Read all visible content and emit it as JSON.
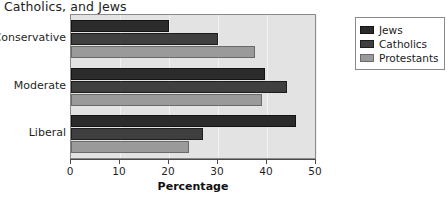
{
  "chart_data": {
    "type": "bar",
    "orientation": "horizontal",
    "title": "Catholics, and Jews",
    "xlabel": "Percentage",
    "ylabel": "",
    "categories": [
      "Conservative",
      "Moderate",
      "Liberal"
    ],
    "series": [
      {
        "name": "Jews",
        "color": "#2b2b2b",
        "values": [
          20.0,
          39.5,
          46.0
        ]
      },
      {
        "name": "Catholics",
        "color": "#3f3f3f",
        "values": [
          30.0,
          44.0,
          27.0
        ]
      },
      {
        "name": "Protestants",
        "color": "#9a9a9a",
        "values": [
          37.5,
          39.0,
          24.0
        ]
      }
    ],
    "xlim": [
      0,
      50
    ],
    "xticks": [
      0,
      10,
      20,
      30,
      40,
      50
    ],
    "xtick_labels": [
      "0",
      "10",
      "20",
      "30",
      "40",
      "50"
    ],
    "grid": true,
    "legend_position": "right",
    "plot_background": "#e3e3e3"
  }
}
